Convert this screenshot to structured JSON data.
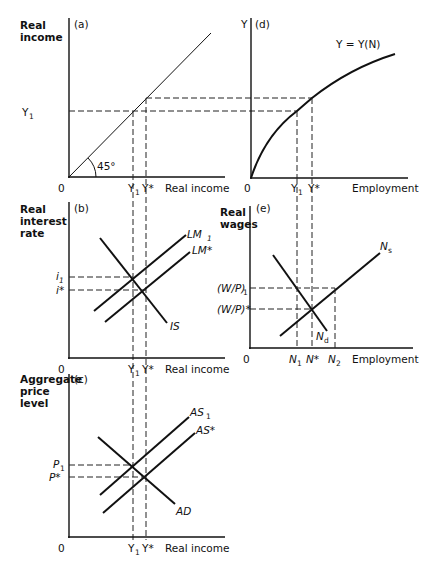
{
  "header": {
    "running_title": "CLASSICAL MODEL OF OUTPUT"
  },
  "panels": {
    "a": {
      "tag": "(a)",
      "ylabel_line1": "Real",
      "ylabel_line2": "income",
      "xlabel": "Real income",
      "origin": "0",
      "angle": "45°",
      "y_tick": "Y",
      "y_tick_sub": "1",
      "x_ticks": [
        {
          "main": "Y",
          "sub": "1"
        },
        {
          "main": "Y*",
          "sub": ""
        }
      ]
    },
    "d": {
      "tag": "(d)",
      "ylabel": "Y",
      "xlabel": "Employment",
      "origin": "0",
      "curve_label": "Y = Y(N)",
      "x_ticks": [
        {
          "main": "Y",
          "sub": "1"
        },
        {
          "main": "Y*",
          "sub": ""
        }
      ]
    },
    "b": {
      "tag": "(b)",
      "ylabel_line1": "Real",
      "ylabel_line2": "interest",
      "ylabel_line3": "rate",
      "xlabel": "Real income",
      "origin": "0",
      "y_ticks": [
        {
          "main": "i",
          "sub": "1"
        },
        {
          "main": "i*",
          "sub": ""
        }
      ],
      "x_ticks": [
        {
          "main": "Y",
          "sub": "1"
        },
        {
          "main": "Y*",
          "sub": ""
        }
      ],
      "curves": {
        "lm1": "LM",
        "lm1_sub": "1",
        "lmstar": "LM*",
        "is": "IS"
      }
    },
    "e": {
      "tag": "(e)",
      "ylabel_line1": "Real",
      "ylabel_line2": "wages",
      "xlabel": "Employment",
      "origin": "0",
      "y_ticks": [
        {
          "main": "(W/P)",
          "sub": "1"
        },
        {
          "main": "(W/P)*",
          "sub": ""
        }
      ],
      "x_ticks": [
        {
          "main": "N",
          "sub": "1"
        },
        {
          "main": "N*",
          "sub": ""
        },
        {
          "main": "N",
          "sub": "2"
        }
      ],
      "curves": {
        "ns": "N",
        "ns_sub": "s",
        "nd": "N",
        "nd_sub": "d"
      }
    },
    "c": {
      "tag": "(c)",
      "ylabel_line1": "Aggregate",
      "ylabel_line2": "price",
      "ylabel_line3": "level",
      "xlabel": "Real income",
      "origin": "0",
      "y_ticks": [
        {
          "main": "P",
          "sub": "1"
        },
        {
          "main": "P*",
          "sub": ""
        }
      ],
      "x_ticks": [
        {
          "main": "Y",
          "sub": "1"
        },
        {
          "main": "Y*",
          "sub": ""
        }
      ],
      "curves": {
        "as1": "AS",
        "as1_sub": "1",
        "asstar": "AS*",
        "ad": "AD"
      }
    }
  }
}
